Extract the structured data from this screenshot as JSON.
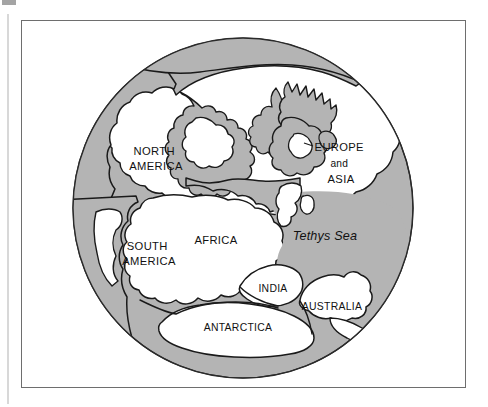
{
  "figure": {
    "type": "diagram"
  },
  "colors": {
    "ocean": "#b4b4b4",
    "land": "#ffffff",
    "outline": "#1a1a1a",
    "frame": "#6e6e6e",
    "label": "#111111",
    "page_background": "#ffffff"
  },
  "globe": {
    "center_x": 243,
    "center_y": 208,
    "radius": 170
  },
  "labels": [
    {
      "id": "north-america",
      "lines": [
        "NORTH",
        "AMERICA"
      ],
      "x": 156,
      "y": 157,
      "style": "label-lg"
    },
    {
      "id": "europe-and-asia",
      "lines": [
        "EUROPE",
        "and",
        "ASIA"
      ],
      "x": 341,
      "y": 152,
      "style": "label-lg"
    },
    {
      "id": "tethys-sea",
      "lines": [
        "Tethys Sea"
      ],
      "x": 325,
      "y": 237,
      "style": "label-sea"
    },
    {
      "id": "south-america",
      "lines": [
        "SOUTH",
        "AMERICA"
      ],
      "x": 149,
      "y": 253,
      "style": "label-lg"
    },
    {
      "id": "africa",
      "lines": [
        "AFRICA"
      ],
      "x": 216,
      "y": 241,
      "style": "label-lg"
    },
    {
      "id": "india",
      "lines": [
        "INDIA"
      ],
      "x": 273,
      "y": 289,
      "style": "label-md"
    },
    {
      "id": "australia",
      "lines": [
        "AUSTRALIA"
      ],
      "x": 332,
      "y": 307,
      "style": "label-md"
    },
    {
      "id": "antarctica",
      "lines": [
        "ANTARCTICA"
      ],
      "x": 238,
      "y": 328,
      "style": "label-md"
    }
  ],
  "label_text": {
    "north_america_1": "NORTH",
    "north_america_2": "AMERICA",
    "europe": "EUROPE",
    "and": "and",
    "asia": "ASIA",
    "tethys_sea": "Tethys Sea",
    "south_america_1": "SOUTH",
    "south_america_2": "AMERICA",
    "africa": "AFRICA",
    "india": "INDIA",
    "australia": "AUSTRALIA",
    "antarctica": "ANTARCTICA"
  }
}
